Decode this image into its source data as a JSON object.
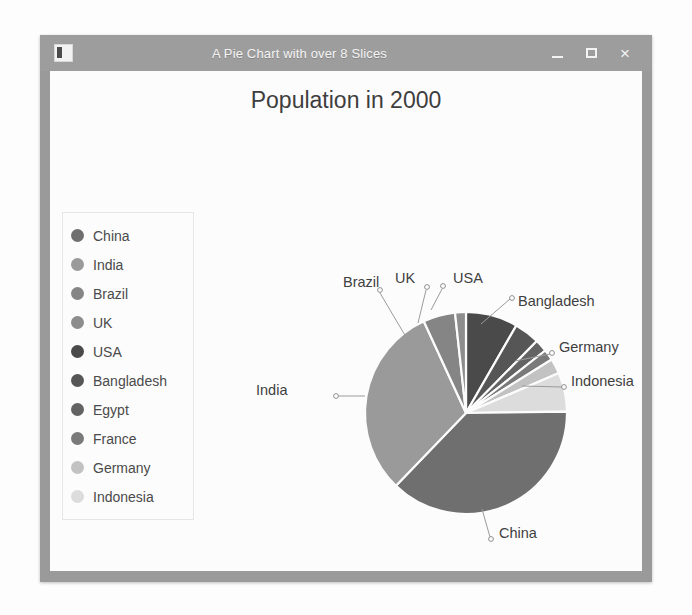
{
  "window": {
    "title": "A Pie Chart with over 8 Slices",
    "app_icon": "chart-app-icon",
    "controls": {
      "minimize": "minimize-icon",
      "maximize": "maximize-icon",
      "close": "×"
    }
  },
  "chart_data": {
    "type": "pie",
    "title": "Population in 2000",
    "xlabel": "",
    "ylabel": "",
    "legend_position": "left",
    "grid": false,
    "categories": [
      "China",
      "India",
      "Brazil",
      "UK",
      "USA",
      "Bangladesh",
      "Egypt",
      "France",
      "Germany",
      "Indonesia"
    ],
    "values": [
      1270,
      1050,
      174,
      59,
      282,
      138,
      68,
      59,
      82,
      212
    ],
    "percentages": [
      36.4,
      30.1,
      5.0,
      1.7,
      8.1,
      4.0,
      2.0,
      1.7,
      2.4,
      6.1
    ],
    "slice_order_clockwise_from_top": [
      "USA",
      "Bangladesh",
      "Egypt",
      "France",
      "Germany",
      "Indonesia",
      "China",
      "India",
      "Brazil",
      "UK"
    ],
    "colors": [
      "#6f6f6f",
      "#9a9a9a",
      "#858585",
      "#8d8d8d",
      "#4a4a4a",
      "#565656",
      "#636363",
      "#7a7a7a",
      "#c2c2c2",
      "#dcdcdc"
    ],
    "callout_labels": [
      "Brazil",
      "UK",
      "USA",
      "Bangladesh",
      "Germany",
      "Indonesia",
      "India",
      "China"
    ]
  },
  "legend": {
    "items": [
      {
        "label": "China",
        "color": "#6f6f6f"
      },
      {
        "label": "India",
        "color": "#9a9a9a"
      },
      {
        "label": "Brazil",
        "color": "#858585"
      },
      {
        "label": "UK",
        "color": "#8d8d8d"
      },
      {
        "label": "USA",
        "color": "#4a4a4a"
      },
      {
        "label": "Bangladesh",
        "color": "#565656"
      },
      {
        "label": "Egypt",
        "color": "#636363"
      },
      {
        "label": "France",
        "color": "#7a7a7a"
      },
      {
        "label": "Germany",
        "color": "#c2c2c2"
      },
      {
        "label": "Indonesia",
        "color": "#dcdcdc"
      }
    ]
  },
  "callouts": {
    "brazil": "Brazil",
    "uk": "UK",
    "usa": "USA",
    "bangladesh": "Bangladesh",
    "germany": "Germany",
    "indonesia": "Indonesia",
    "india": "India",
    "china": "China"
  }
}
